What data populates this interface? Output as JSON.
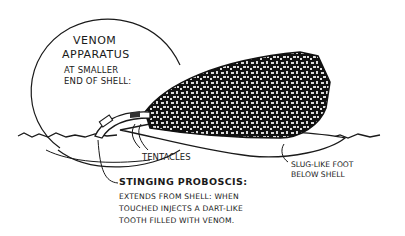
{
  "diagram": {
    "labels": {
      "venom_title_line1": "Venom",
      "venom_title_line2": "Apparatus",
      "venom_sub_line1": "at smaller",
      "venom_sub_line2": "end of shell:",
      "tentacles": "Tentacles",
      "proboscis_title": "Stinging proboscis:",
      "proboscis_desc_line1": "Extends from shell: when",
      "proboscis_desc_line2": "touched injects a dart-like",
      "proboscis_desc_line3": "tooth filled with venom.",
      "foot_line1": "Slug-like foot",
      "foot_line2": "below shell"
    },
    "colors": {
      "ink": "#1a1a1a",
      "paper": "#ffffff"
    }
  }
}
